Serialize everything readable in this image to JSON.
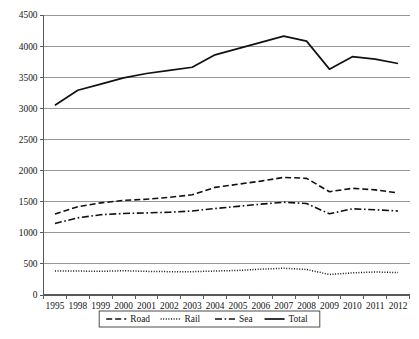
{
  "chart_data": {
    "type": "line",
    "title": "",
    "subtitle": "",
    "xlabel": "",
    "ylabel": "",
    "categories": [
      "1995",
      "1998",
      "1999",
      "2000",
      "2001",
      "2002",
      "2003",
      "2004",
      "2005",
      "2006",
      "2007",
      "2008",
      "2009",
      "2010",
      "2011",
      "2012"
    ],
    "ylim": [
      0,
      4500
    ],
    "ytick_step": 500,
    "yticks": [
      "0",
      "500",
      "1000",
      "1500",
      "2000",
      "2500",
      "3000",
      "3500",
      "4000",
      "4500"
    ],
    "grid": true,
    "legend_position": "bottom",
    "series": [
      {
        "name": "Road",
        "style": "dashed",
        "values": [
          1300,
          1420,
          1480,
          1520,
          1540,
          1570,
          1610,
          1730,
          1780,
          1830,
          1890,
          1875,
          1660,
          1715,
          1690,
          1640
        ]
      },
      {
        "name": "Rail",
        "style": "dotted",
        "values": [
          385,
          385,
          380,
          390,
          380,
          375,
          375,
          385,
          395,
          415,
          430,
          410,
          330,
          355,
          370,
          360
        ]
      },
      {
        "name": "Sea",
        "style": "dash-dot",
        "values": [
          1150,
          1240,
          1290,
          1310,
          1320,
          1330,
          1350,
          1390,
          1425,
          1460,
          1490,
          1470,
          1305,
          1385,
          1370,
          1350
        ]
      },
      {
        "name": "Total",
        "style": "solid",
        "values": [
          3050,
          3290,
          3390,
          3490,
          3560,
          3610,
          3660,
          3860,
          3960,
          4060,
          4160,
          4080,
          3630,
          3830,
          3790,
          3720
        ]
      }
    ]
  },
  "legend": {
    "items": [
      {
        "label": "Road",
        "style": "dashed"
      },
      {
        "label": "Rail",
        "style": "dotted"
      },
      {
        "label": "Sea",
        "style": "dash-dot"
      },
      {
        "label": "Total",
        "style": "solid"
      }
    ]
  },
  "colors": {
    "series": "#111111",
    "gridline": "#8c8c8c",
    "axis": "#5a5a5a",
    "background": "#ffffff",
    "text": "#141414"
  }
}
